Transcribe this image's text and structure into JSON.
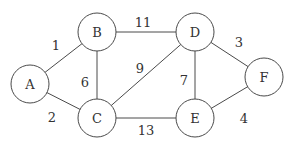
{
  "graph": {
    "nodes": [
      {
        "id": "A",
        "label": "A",
        "x": 30,
        "y": 84
      },
      {
        "id": "B",
        "label": "B",
        "x": 97,
        "y": 32
      },
      {
        "id": "C",
        "label": "C",
        "x": 97,
        "y": 118
      },
      {
        "id": "D",
        "label": "D",
        "x": 195,
        "y": 32
      },
      {
        "id": "E",
        "label": "E",
        "x": 195,
        "y": 118
      },
      {
        "id": "F",
        "label": "F",
        "x": 264,
        "y": 77
      }
    ],
    "edges": [
      {
        "from": "A",
        "to": "B",
        "weight": "1",
        "lx": 56,
        "ly": 45
      },
      {
        "from": "A",
        "to": "C",
        "weight": "2",
        "lx": 52,
        "ly": 117
      },
      {
        "from": "B",
        "to": "C",
        "weight": "6",
        "lx": 85,
        "ly": 82
      },
      {
        "from": "B",
        "to": "D",
        "weight": "11",
        "lx": 143,
        "ly": 22
      },
      {
        "from": "C",
        "to": "D",
        "weight": "9",
        "lx": 140,
        "ly": 68
      },
      {
        "from": "C",
        "to": "E",
        "weight": "13",
        "lx": 146,
        "ly": 130
      },
      {
        "from": "D",
        "to": "E",
        "weight": "7",
        "lx": 184,
        "ly": 80
      },
      {
        "from": "D",
        "to": "F",
        "weight": "3",
        "lx": 239,
        "ly": 42
      },
      {
        "from": "E",
        "to": "F",
        "weight": "4",
        "lx": 244,
        "ly": 118
      }
    ]
  }
}
